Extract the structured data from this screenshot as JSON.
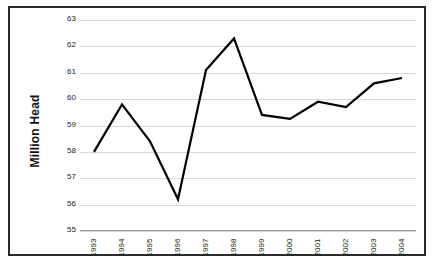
{
  "chart_data": {
    "type": "line",
    "title": "",
    "xlabel": "",
    "ylabel": "Million Head",
    "categories": [
      "1993",
      "1994",
      "1995",
      "1996",
      "1997",
      "1998",
      "1999",
      "2000",
      "2001",
      "2002",
      "2003",
      "2004"
    ],
    "values": [
      58.0,
      59.8,
      58.4,
      56.2,
      61.1,
      62.3,
      59.4,
      59.25,
      59.9,
      59.7,
      60.6,
      60.8
    ],
    "series": [
      {
        "name": "Million Head",
        "values": [
          58.0,
          59.8,
          58.4,
          56.2,
          61.1,
          62.3,
          59.4,
          59.25,
          59.9,
          59.7,
          60.6,
          60.8
        ]
      }
    ],
    "ylim": [
      55,
      63
    ],
    "ytick_step": 1,
    "yticks": [
      63,
      62,
      61,
      60,
      59,
      58,
      57,
      56,
      55
    ],
    "ytick_labels": [
      "63",
      "62",
      "61",
      "60",
      "59",
      "58",
      "57",
      "56",
      "55"
    ],
    "grid": true,
    "legend": false,
    "legend_position": "none",
    "line_color": "#000000",
    "line_width": 2.2,
    "plot_background": "#ffffff",
    "gridline_color": "#d7d7d7",
    "border_color": "#2b2b2b"
  }
}
